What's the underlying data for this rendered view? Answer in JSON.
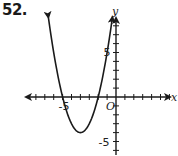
{
  "problem": {
    "number": "52."
  },
  "chart_data": {
    "type": "line",
    "title": "",
    "xlabel": "x",
    "ylabel": "y",
    "origin_label": "O",
    "tick_labels": {
      "x": [
        "-5"
      ],
      "y": [
        "5",
        "-5"
      ]
    },
    "xlim": [
      -10,
      7
    ],
    "ylim": [
      -6,
      9
    ],
    "grid": false,
    "legend": null,
    "series": [
      {
        "name": "parabola",
        "equation": "y = x^2 + 8x + 12",
        "roots": [
          -6,
          -2
        ],
        "vertex": [
          -4,
          -4
        ],
        "x": [
          -7.6,
          -7,
          -6,
          -5,
          -4,
          -3,
          -2,
          -1,
          -0.4
        ],
        "y": [
          8.96,
          5,
          0,
          -3,
          -4,
          -3,
          0,
          5,
          8.96
        ],
        "arrows_both_ends": true
      }
    ],
    "color": "#1a1a1a"
  }
}
